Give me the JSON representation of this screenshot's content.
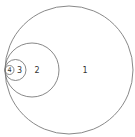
{
  "diagram": {
    "type": "nested-tangent-circles",
    "stroke_color": "#7a7a7a",
    "circles": [
      {
        "label": "1",
        "cx": 69,
        "cy": 70,
        "r": 64
      },
      {
        "label": "2",
        "cx": 32,
        "cy": 70,
        "r": 27
      },
      {
        "label": "3",
        "cx": 15.5,
        "cy": 70,
        "r": 10.5
      },
      {
        "label": "4",
        "cx": 9.5,
        "cy": 70,
        "r": 4.5
      }
    ],
    "labels": {
      "c1": "1",
      "c2": "2",
      "c3": "3",
      "c4": "4"
    }
  }
}
